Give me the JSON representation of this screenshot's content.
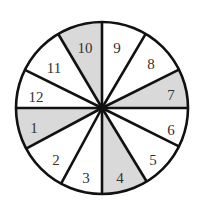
{
  "spinner": {
    "center": [
      102,
      108
    ],
    "radius": 86,
    "shade_color": "#d9d9d9",
    "line_color": "#111111",
    "boundaries": [
      [
        102,
        22
      ],
      [
        145,
        35
      ],
      [
        180,
        69
      ],
      [
        188,
        108
      ],
      [
        182,
        148
      ],
      [
        147,
        182
      ],
      [
        102,
        194
      ],
      [
        62,
        182
      ],
      [
        29,
        147
      ],
      [
        16,
        108
      ],
      [
        27,
        71
      ],
      [
        60,
        37
      ]
    ],
    "sectors": [
      {
        "label": "9",
        "shaded": false,
        "pos": [
          117,
          50
        ]
      },
      {
        "label": "8",
        "shaded": false,
        "pos": [
          151,
          66
        ]
      },
      {
        "label": "7",
        "shaded": true,
        "pos": [
          171,
          97
        ]
      },
      {
        "label": "6",
        "shaded": false,
        "pos": [
          171,
          132
        ]
      },
      {
        "label": "5",
        "shaded": false,
        "pos": [
          153,
          162
        ]
      },
      {
        "label": "4",
        "shaded": true,
        "pos": [
          120,
          180
        ]
      },
      {
        "label": "3",
        "shaded": false,
        "pos": [
          86,
          180
        ]
      },
      {
        "label": "2",
        "shaded": false,
        "pos": [
          56,
          162
        ]
      },
      {
        "label": "1",
        "shaded": true,
        "pos": [
          34,
          130
        ]
      },
      {
        "label": "12",
        "shaded": false,
        "pos": [
          36,
          99
        ]
      },
      {
        "label": "11",
        "shaded": false,
        "pos": [
          54,
          70
        ]
      },
      {
        "label": "10",
        "shaded": true,
        "pos": [
          85,
          50
        ]
      }
    ]
  }
}
